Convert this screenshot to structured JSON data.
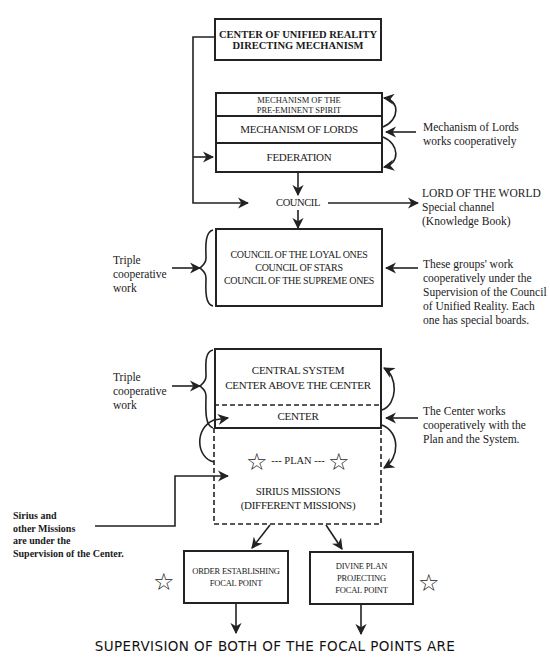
{
  "diagram": {
    "top_box": {
      "line1": "CENTER OF UNIFIED REALITY",
      "line2": "DIRECTING MECHANISM"
    },
    "mechanism_box": {
      "pre_eminent_line1": "MECHANISM OF THE",
      "pre_eminent_line2": "PRE-EMINENT SPIRIT",
      "lords": "MECHANISM OF LORDS",
      "federation": "FEDERATION"
    },
    "mechanism_annotation": {
      "line1": "Mechanism of Lords",
      "line2": "works cooperatively"
    },
    "council_label": "COUNCIL",
    "lord_of_world": {
      "line1": "LORD OF THE WORLD",
      "line2": "Special channel",
      "line3": "(Knowledge Book)"
    },
    "councils_box": {
      "line1": "COUNCIL OF THE LOYAL ONES",
      "line2": "COUNCIL OF STARS",
      "line3": "COUNCIL OF THE SUPREME ONES"
    },
    "triple_work_1": {
      "line1": "Triple",
      "line2": "cooperative",
      "line3": "work"
    },
    "councils_annotation": {
      "line1": "These groups' work",
      "line2": "cooperatively under the",
      "line3": "Supervision of the Council",
      "line4": "of Unified Reality. Each",
      "line5": "one has special boards."
    },
    "central_box": {
      "line1": "CENTRAL SYSTEM",
      "line2": "CENTER ABOVE THE CENTER",
      "center": "CENTER"
    },
    "triple_work_2": {
      "line1": "Triple",
      "line2": "cooperative",
      "line3": "work"
    },
    "center_annotation": {
      "line1": "The Center works",
      "line2": "cooperatively with the",
      "line3": "Plan and the System."
    },
    "plan_box": {
      "plan": "--- PLAN ---",
      "line1": "SIRIUS MISSIONS",
      "line2": "(DIFFERENT MISSIONS)",
      "star_icon": "☆"
    },
    "sirius_annotation": {
      "line1": "Sirius and",
      "line2": "other Missions",
      "line3": "are under the",
      "line4": "Supervision of the Center."
    },
    "focal_left": {
      "line1": "ORDER ESTABLISHING",
      "line2": "FOCAL POINT"
    },
    "focal_right": {
      "line1": "DIVINE PLAN",
      "line2": "PROJECTING",
      "line3": "FOCAL POINT"
    },
    "footer": "SUPERVISION OF BOTH OF THE FOCAL POINTS ARE",
    "colors": {
      "ink": "#222222",
      "background": "#ffffff"
    }
  }
}
